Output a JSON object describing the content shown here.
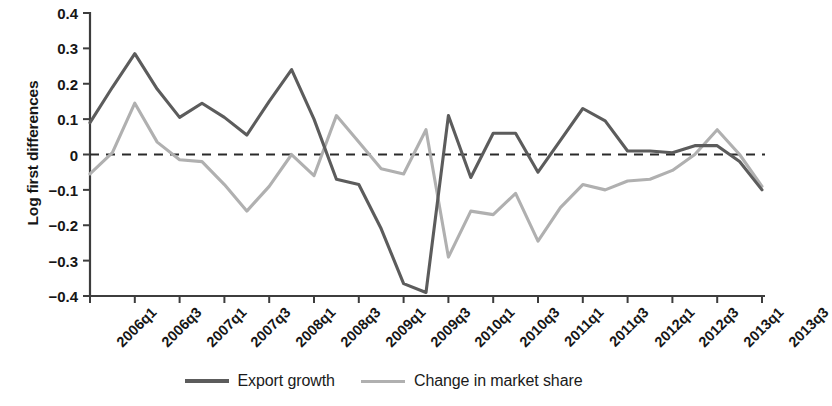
{
  "chart_data": {
    "type": "line",
    "title": "",
    "xlabel": "",
    "ylabel": "Log first differences",
    "ylim": [
      -0.4,
      0.4
    ],
    "yticks": [
      "0.4",
      "0.3",
      "0.2",
      "0.1",
      "0",
      "−0.1",
      "−0.2",
      "−0.3",
      "−0.4"
    ],
    "ytick_values": [
      0.4,
      0.3,
      0.2,
      0.1,
      0,
      -0.1,
      -0.2,
      -0.3,
      -0.4
    ],
    "grid": false,
    "zero_line": true,
    "zero_line_style": "dashed",
    "legend_position": "bottom-center",
    "xtick_labels": [
      "2006q1",
      "2006q3",
      "2007q1",
      "2007q3",
      "2008q1",
      "2008q3",
      "2009q1",
      "2009q3",
      "2010q1",
      "2010q3",
      "2011q1",
      "2011q3",
      "2012q1",
      "2012q3",
      "2013q1",
      "2013q3"
    ],
    "x": [
      "2006q1",
      "2006q2",
      "2006q3",
      "2006q4",
      "2007q1",
      "2007q2",
      "2007q3",
      "2007q4",
      "2008q1",
      "2008q2",
      "2008q3",
      "2008q4",
      "2009q1",
      "2009q2",
      "2009q3",
      "2009q4",
      "2010q1",
      "2010q2",
      "2010q3",
      "2010q4",
      "2011q1",
      "2011q2",
      "2011q3",
      "2011q4",
      "2012q1",
      "2012q2",
      "2012q3",
      "2012q4",
      "2013q1",
      "2013q2",
      "2013q3"
    ],
    "series": [
      {
        "name": "Export growth",
        "color": "#5c5c5c",
        "values": [
          0.09,
          0.19,
          0.285,
          0.185,
          0.105,
          0.145,
          0.105,
          0.055,
          0.15,
          0.24,
          0.1,
          -0.07,
          -0.085,
          -0.21,
          -0.365,
          -0.39,
          0.11,
          -0.065,
          0.06,
          0.06,
          -0.05,
          0.04,
          0.13,
          0.095,
          0.01,
          0.01,
          0.005,
          0.025,
          0.025,
          -0.02,
          -0.1
        ]
      },
      {
        "name": "Change in market share",
        "color": "#b0b0b0",
        "values": [
          -0.055,
          0.005,
          0.145,
          0.035,
          -0.015,
          -0.02,
          -0.085,
          -0.16,
          -0.09,
          0.0,
          -0.06,
          0.11,
          0.035,
          -0.04,
          -0.055,
          0.07,
          -0.29,
          -0.16,
          -0.17,
          -0.11,
          -0.245,
          -0.15,
          -0.085,
          -0.1,
          -0.075,
          -0.07,
          -0.045,
          0.0,
          0.07,
          0.0,
          -0.09
        ]
      }
    ]
  },
  "legend": {
    "entries": [
      {
        "label": "Export growth",
        "color": "#5c5c5c"
      },
      {
        "label": "Change in market share",
        "color": "#b0b0b0"
      }
    ]
  },
  "axis": {
    "color": "#3d3d3d",
    "zero_line_color": "#2a2a2a"
  }
}
